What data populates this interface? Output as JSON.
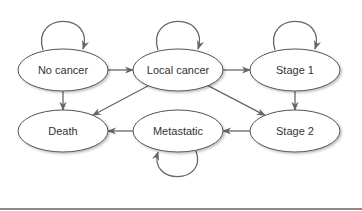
{
  "diagram": {
    "type": "state-transition",
    "nodes": [
      {
        "id": "no_cancer",
        "label": "No cancer"
      },
      {
        "id": "local_cancer",
        "label": "Local cancer"
      },
      {
        "id": "stage1",
        "label": "Stage 1"
      },
      {
        "id": "death",
        "label": "Death"
      },
      {
        "id": "metastatic",
        "label": "Metastatic"
      },
      {
        "id": "stage2",
        "label": "Stage 2"
      }
    ],
    "edges": [
      {
        "from": "no_cancer",
        "to": "no_cancer"
      },
      {
        "from": "local_cancer",
        "to": "local_cancer"
      },
      {
        "from": "stage1",
        "to": "stage1"
      },
      {
        "from": "metastatic",
        "to": "metastatic"
      },
      {
        "from": "no_cancer",
        "to": "local_cancer"
      },
      {
        "from": "local_cancer",
        "to": "stage1"
      },
      {
        "from": "no_cancer",
        "to": "death"
      },
      {
        "from": "local_cancer",
        "to": "death"
      },
      {
        "from": "local_cancer",
        "to": "stage2"
      },
      {
        "from": "stage1",
        "to": "stage2"
      },
      {
        "from": "stage2",
        "to": "metastatic"
      },
      {
        "from": "metastatic",
        "to": "death"
      }
    ]
  }
}
